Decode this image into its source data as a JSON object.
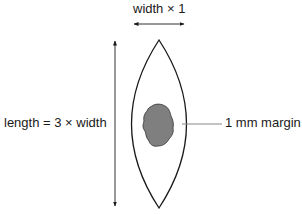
{
  "diagram": {
    "type": "elliptical-excision-schematic",
    "labels": {
      "width": "width × 1",
      "length": "length = 3 × width",
      "margin": "1 mm margin"
    },
    "elements": {
      "excision": "lens-shaped (fusiform) outline",
      "lesion": "irregular gray lesion at center",
      "width_arrow": "horizontal double-headed arrow",
      "length_arrow": "vertical double-headed arrow",
      "margin_leader": "leader line from lens edge to margin label"
    },
    "colors": {
      "outline": "#1a1a1a",
      "lesion_fill": "#7f7f7f",
      "leader_line": "#888888",
      "background": "#ffffff"
    }
  }
}
